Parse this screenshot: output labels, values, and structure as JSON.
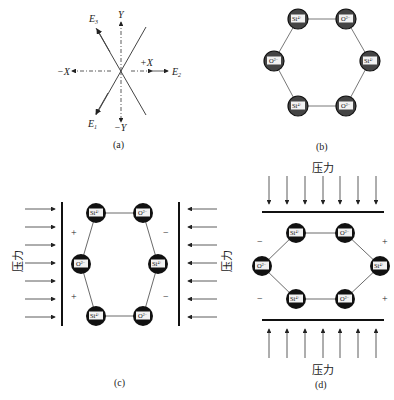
{
  "panel_a": {
    "caption": "(a)",
    "axes": {
      "y_pos": "Y",
      "y_neg": "−Y",
      "x_pos": "+X",
      "x_neg": "−X"
    },
    "e_labels": {
      "e1": "E",
      "e1_sub": "1",
      "e2": "E",
      "e2_sub": "2",
      "e3": "E",
      "e3_sub": "3"
    }
  },
  "panel_b": {
    "caption": "(b)",
    "nodes": [
      "Si4+",
      "O2−",
      "Si4+",
      "O2−",
      "Si4+",
      "O2−"
    ]
  },
  "panel_c": {
    "caption": "(c)",
    "force_label": "压力",
    "left_sign": "+",
    "right_sign": "−"
  },
  "panel_d": {
    "caption": "(d)",
    "force_label_top": "压力",
    "force_label_bottom": "压力",
    "left_sign": "−",
    "right_sign": "+"
  },
  "ions": {
    "si": "Si",
    "si_sup": "4+",
    "o": "O",
    "o_sup": "2−"
  },
  "colors": {
    "line": "#333333",
    "node": "#1a1a1a",
    "node_b": "#555555",
    "box": "#f2f2f2"
  }
}
